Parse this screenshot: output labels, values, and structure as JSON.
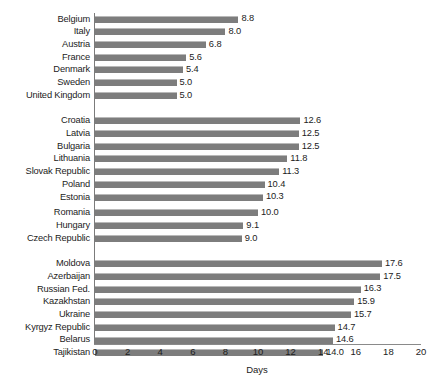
{
  "chart_data": {
    "type": "bar",
    "orientation": "horizontal",
    "title": "",
    "subtitle": "",
    "xlabel": "Days",
    "ylabel": "",
    "xlim": [
      0,
      20
    ],
    "xticks": [
      0,
      2,
      4,
      6,
      8,
      10,
      12,
      14,
      16,
      18,
      20
    ],
    "xtick_labels": [
      "0",
      "2",
      "4",
      "6",
      "8",
      "10",
      "12",
      "14",
      "16",
      "18",
      "20"
    ],
    "grid": false,
    "legend": null,
    "bar_color": "#7d7d7d",
    "value_label_format": "one-decimal",
    "categories": [
      "Belgium",
      "Italy",
      "Austria",
      "France",
      "Denmark",
      "Sweden",
      "United Kingdom",
      "Croatia",
      "Latvia",
      "Bulgaria",
      "Lithuania",
      "Slovak Republic",
      "Poland",
      "Estonia",
      "Romania",
      "Hungary",
      "Czech Republic",
      "Moldova",
      "Azerbaijan",
      "Russian Fed.",
      "Kazakhstan",
      "Ukraine",
      "Kyrgyz Republic",
      "Belarus",
      "Tajikistan"
    ],
    "values": [
      8.8,
      8.0,
      6.8,
      5.6,
      5.4,
      5.0,
      5.0,
      12.6,
      12.5,
      12.5,
      11.8,
      11.3,
      10.4,
      10.3,
      10.0,
      9.1,
      9.0,
      17.6,
      17.5,
      16.3,
      15.9,
      15.7,
      14.7,
      14.6,
      14.0
    ],
    "groups": [
      {
        "name": "group-1",
        "bars": [
          {
            "label": "Belgium",
            "value": 8.8,
            "value_label": "8.8"
          },
          {
            "label": "Italy",
            "value": 8.0,
            "value_label": "8.0"
          },
          {
            "label": "Austria",
            "value": 6.8,
            "value_label": "6.8"
          },
          {
            "label": "France",
            "value": 5.6,
            "value_label": "5.6"
          },
          {
            "label": "Denmark",
            "value": 5.4,
            "value_label": "5.4"
          },
          {
            "label": "Sweden",
            "value": 5.0,
            "value_label": "5.0"
          },
          {
            "label": "United Kingdom",
            "value": 5.0,
            "value_label": "5.0"
          }
        ]
      },
      {
        "name": "group-2",
        "bars": [
          {
            "label": "Croatia",
            "value": 12.6,
            "value_label": "12.6"
          },
          {
            "label": "Latvia",
            "value": 12.5,
            "value_label": "12.5"
          },
          {
            "label": "Bulgaria",
            "value": 12.5,
            "value_label": "12.5"
          },
          {
            "label": "Lithuania",
            "value": 11.8,
            "value_label": "11.8"
          },
          {
            "label": "Slovak Republic",
            "value": 11.3,
            "value_label": "11.3"
          },
          {
            "label": "Poland",
            "value": 10.4,
            "value_label": "10.4"
          },
          {
            "label": "Estonia",
            "value": 10.3,
            "value_label": "10.3"
          },
          {
            "label": "Romania",
            "value": 10.0,
            "value_label": "10.0",
            "sub_gap": true
          },
          {
            "label": "Hungary",
            "value": 9.1,
            "value_label": "9.1"
          },
          {
            "label": "Czech Republic",
            "value": 9.0,
            "value_label": "9.0"
          }
        ]
      },
      {
        "name": "group-3",
        "bars": [
          {
            "label": "Moldova",
            "value": 17.6,
            "value_label": "17.6"
          },
          {
            "label": "Azerbaijan",
            "value": 17.5,
            "value_label": "17.5"
          },
          {
            "label": "Russian Fed.",
            "value": 16.3,
            "value_label": "16.3"
          },
          {
            "label": "Kazakhstan",
            "value": 15.9,
            "value_label": "15.9"
          },
          {
            "label": "Ukraine",
            "value": 15.7,
            "value_label": "15.7"
          },
          {
            "label": "Kyrgyz Republic",
            "value": 14.7,
            "value_label": "14.7"
          },
          {
            "label": "Belarus",
            "value": 14.6,
            "value_label": "14.6"
          },
          {
            "label": "Tajikistan",
            "value": 14.0,
            "value_label": "14.0"
          }
        ]
      }
    ]
  }
}
